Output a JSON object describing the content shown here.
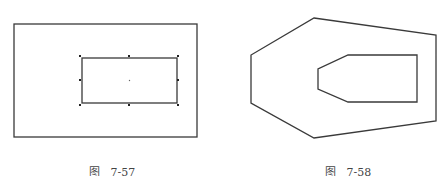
{
  "figures": [
    {
      "id": "fig-7-57",
      "caption_prefix": "图",
      "caption_number": "7-57",
      "caption": "图  7-57",
      "outer_rect": {
        "x": 14,
        "y": 24,
        "w": 183,
        "h": 113
      },
      "inner_rect": {
        "x": 82,
        "y": 58,
        "w": 95,
        "h": 45
      },
      "grips": [
        [
          80,
          56
        ],
        [
          129,
          56
        ],
        [
          178,
          56
        ],
        [
          80,
          80
        ],
        [
          178,
          80
        ],
        [
          80,
          104
        ],
        [
          129,
          104
        ],
        [
          178,
          104
        ]
      ],
      "center_point": [
        129,
        80
      ]
    },
    {
      "id": "fig-7-58",
      "caption_prefix": "图",
      "caption_number": "7-58",
      "caption": "图  7-58",
      "outer_polygon": [
        [
          314,
          18
        ],
        [
          436,
          35
        ],
        [
          436,
          121
        ],
        [
          314,
          138
        ],
        [
          251,
          103
        ],
        [
          251,
          55
        ]
      ],
      "inner_polygon": [
        [
          348,
          55
        ],
        [
          417,
          55
        ],
        [
          417,
          102
        ],
        [
          348,
          102
        ],
        [
          318,
          89
        ],
        [
          318,
          69
        ]
      ]
    }
  ],
  "colors": {
    "line": "#3a3a3a",
    "grip": "#222222",
    "caption": "#444444"
  }
}
